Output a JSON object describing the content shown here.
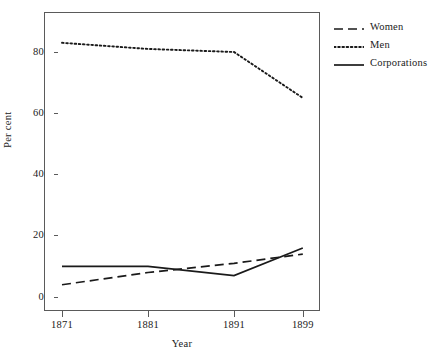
{
  "chart_data": {
    "type": "line",
    "title": "",
    "xlabel": "Year",
    "ylabel": "Per cent",
    "x": [
      1871,
      1881,
      1891,
      1899
    ],
    "xtick_labels": [
      "1871",
      "1881",
      "1891",
      "1899"
    ],
    "ytick_labels": [
      "0",
      "20",
      "40",
      "60",
      "80"
    ],
    "yticks": [
      0,
      20,
      40,
      60,
      80
    ],
    "xlim": [
      1868,
      1902
    ],
    "ylim": [
      -3,
      95
    ],
    "grid": false,
    "legend_position": "right",
    "series": [
      {
        "name": "Women",
        "style": "dashed",
        "color": "#1a1a1a",
        "values": [
          4,
          8,
          11,
          14
        ]
      },
      {
        "name": "Men",
        "style": "dotted",
        "color": "#1a1a1a",
        "values": [
          83,
          81,
          80,
          65
        ]
      },
      {
        "name": "Corporations",
        "style": "solid",
        "color": "#1a1a1a",
        "values": [
          10,
          10,
          7,
          16
        ]
      }
    ]
  },
  "axes": {
    "x_title": "Year",
    "y_title": "Per cent"
  },
  "legend": {
    "entries": [
      {
        "label": "Women",
        "key": "dashed-line-key"
      },
      {
        "label": "Men",
        "key": "dotted-line-key"
      },
      {
        "label": "Corporations",
        "key": "solid-line-key"
      }
    ]
  },
  "geometry": {
    "plot_left": 44,
    "plot_top": 12,
    "plot_width": 276,
    "plot_height": 299,
    "y_zero_px": 297,
    "y_unit_px": 3.0625,
    "x_1871_px": 62,
    "x_per_year_px": 8.6
  }
}
